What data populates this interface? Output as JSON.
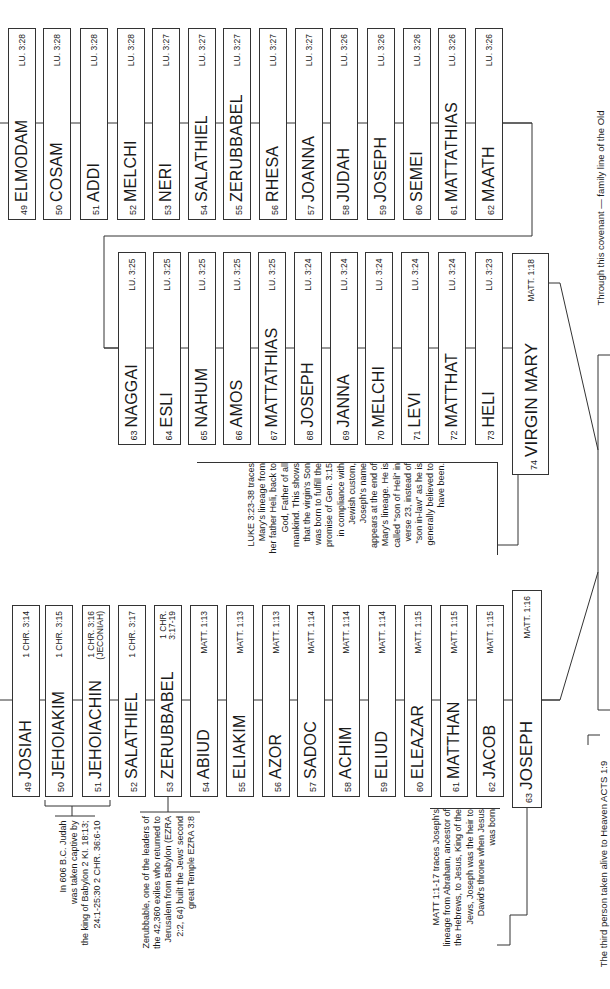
{
  "luke_top_row": [
    {
      "num": "49",
      "name": "ELMODAM",
      "ref": "LU. 3:28"
    },
    {
      "num": "50",
      "name": "COSAM",
      "ref": "LU. 3:28"
    },
    {
      "num": "51",
      "name": "ADDI",
      "ref": "LU. 3:28"
    },
    {
      "num": "52",
      "name": "MELCHI",
      "ref": "LU. 3:28"
    },
    {
      "num": "53",
      "name": "NERI",
      "ref": "LU. 3:27"
    },
    {
      "num": "54",
      "name": "SALATHIEL",
      "ref": "LU. 3:27"
    },
    {
      "num": "55",
      "name": "ZERUBBABEL",
      "ref": "LU. 3:27"
    },
    {
      "num": "56",
      "name": "RHESA",
      "ref": "LU. 3:27"
    },
    {
      "num": "57",
      "name": "JOANNA",
      "ref": "LU. 3:27"
    },
    {
      "num": "58",
      "name": "JUDAH",
      "ref": "LU. 3:26"
    },
    {
      "num": "59",
      "name": "JOSEPH",
      "ref": "LU. 3:26"
    },
    {
      "num": "60",
      "name": "SEMEI",
      "ref": "LU. 3:26"
    },
    {
      "num": "61",
      "name": "MATTATHIAS",
      "ref": "LU. 3:26"
    },
    {
      "num": "62",
      "name": "MAATH",
      "ref": "LU. 3:26"
    }
  ],
  "luke_second_row": [
    {
      "num": "63",
      "name": "NAGGAI",
      "ref": "LU. 3:25"
    },
    {
      "num": "64",
      "name": "ESLI",
      "ref": "LU. 3:25"
    },
    {
      "num": "65",
      "name": "NAHUM",
      "ref": "LU. 3:25"
    },
    {
      "num": "66",
      "name": "AMOS",
      "ref": "LU. 3:25"
    },
    {
      "num": "67",
      "name": "MATTATHIAS",
      "ref": "LU. 3:25"
    },
    {
      "num": "68",
      "name": "JOSEPH",
      "ref": "LU. 3:24"
    },
    {
      "num": "69",
      "name": "JANNA",
      "ref": "LU. 3:24"
    },
    {
      "num": "70",
      "name": "MELCHI",
      "ref": "LU. 3:24"
    },
    {
      "num": "71",
      "name": "LEVI",
      "ref": "LU. 3:24"
    },
    {
      "num": "72",
      "name": "MATTHAT",
      "ref": "LU. 3:24"
    },
    {
      "num": "73",
      "name": "HELI",
      "ref": "LU. 3:23"
    }
  ],
  "virgin_mary": {
    "num": "74",
    "name": "VIRGIN MARY",
    "ref": "MATT. 1:18"
  },
  "matthew_row": [
    {
      "num": "49",
      "name": "JOSIAH",
      "ref": "1 CHR. 3:14"
    },
    {
      "num": "50",
      "name": "JEHOIAKIM",
      "ref": "1 CHR. 3:15"
    },
    {
      "num": "51",
      "name": "JEHOIACHIN",
      "ref": "1 CHR. 3:16\n(JECONIAH)"
    },
    {
      "num": "52",
      "name": "SALATHIEL",
      "ref": "1 CHR. 3:17"
    },
    {
      "num": "53",
      "name": "ZERUBBABEL",
      "ref": "1 CHR.\n3:17-19"
    },
    {
      "num": "54",
      "name": "ABIUD",
      "ref": "MATT. 1:13"
    },
    {
      "num": "55",
      "name": "ELIAKIM",
      "ref": "MATT. 1:13"
    },
    {
      "num": "56",
      "name": "AZOR",
      "ref": "MATT. 1:13"
    },
    {
      "num": "57",
      "name": "SADOC",
      "ref": "MATT. 1:14"
    },
    {
      "num": "58",
      "name": "ACHIM",
      "ref": "MATT. 1:14"
    },
    {
      "num": "59",
      "name": "ELIUD",
      "ref": "MATT. 1:14"
    },
    {
      "num": "60",
      "name": "ELEAZAR",
      "ref": "MATT. 1:15"
    },
    {
      "num": "61",
      "name": "MATTHAN",
      "ref": "MATT. 1:15"
    },
    {
      "num": "62",
      "name": "JACOB",
      "ref": "MATT. 1:15"
    }
  ],
  "joseph": {
    "num": "63",
    "name": "JOSEPH",
    "ref": "MATT. 1:16"
  },
  "notes": {
    "luke": "LUKE 3:23-38 traces\nMary's lineage from\nher father Heli, back to\nGod, Father of all\nmankind. This shows\nthat the virgin's Son\nwas born to fulfill the\npromise of Gen. 3:15\nin compliance with\nJewish custom,\nJoseph's name\nappears at the end of\nMary's lineage. He is\ncalled \"son of Heli\" in\nverse 23, instead of\n\"son in-law\" as he is\ngenerally believed to\nhave been.",
    "compare": "Compare Garbriel's\nAnnunciation (LU.\n1:26-33) with Isaiah's\nprophecy (ISA. 7:14)\nmade 750 yrs.\npreviously",
    "captivity": "In 606 B.C. Judah\nwas taken captive by\nthe king of Babylon 2 KI. 18:13;\n24:1-25:30  2 CHR. 36:6-10",
    "zerubbabel": "Zerubbable, one of the leaders of\nthe 42,360 exiles who returned to\nJerusalem from Babylon (EZRA\n2:2, 64) built the Jews' second\ngreat Temple EZRA 3:8",
    "matt": "MATT 1:1-17 traces Joseph's\nlineage from Abraham, ancestor of\nthe Hebrews, to Jesus, King of the\nJews, Joseph was the heir to\nDavid's throne when Jesus\nwas born"
  },
  "captions": {
    "covenant": "Through this covenant — family line of the Old",
    "third_person": "The third person taken alive to Heaven ACTS 1:9"
  }
}
